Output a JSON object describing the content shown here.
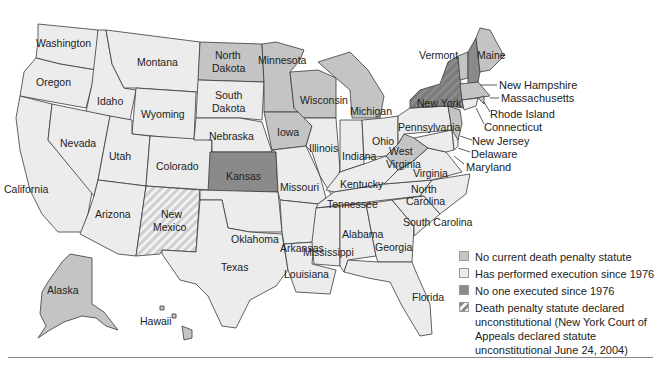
{
  "colors": {
    "no_statute": "#c4c4c4",
    "executed": "#ececec",
    "not_executed": "#8a8a8a",
    "unconstitutional_stripe": "#cfcfcf",
    "background": "#ffffff",
    "border": "#3a3a3a"
  },
  "legend": {
    "items": [
      {
        "key": "no_statute",
        "label": "No current death penalty statute"
      },
      {
        "key": "executed",
        "label": "Has performed execution since 1976"
      },
      {
        "key": "not_executed",
        "label": "No one executed since 1976"
      },
      {
        "key": "unconstitutional",
        "label": "Death penalty statute declared unconstitutional (New York Court of Appeals declared statute unconstitutional June 24, 2004)"
      }
    ]
  },
  "states": {
    "washington": {
      "label": "Washington",
      "category": "executed"
    },
    "oregon": {
      "label": "Oregon",
      "category": "executed"
    },
    "california": {
      "label": "California",
      "category": "executed"
    },
    "idaho": {
      "label": "Idaho",
      "category": "executed"
    },
    "nevada": {
      "label": "Nevada",
      "category": "executed"
    },
    "montana": {
      "label": "Montana",
      "category": "executed"
    },
    "wyoming": {
      "label": "Wyoming",
      "category": "executed"
    },
    "utah": {
      "label": "Utah",
      "category": "executed"
    },
    "arizona": {
      "label": "Arizona",
      "category": "executed"
    },
    "colorado": {
      "label": "Colorado",
      "category": "executed"
    },
    "new_mexico": {
      "label1": "New",
      "label2": "Mexico",
      "category": "unconstitutional"
    },
    "north_dakota": {
      "label1": "North",
      "label2": "Dakota",
      "category": "no_statute"
    },
    "south_dakota": {
      "label1": "South",
      "label2": "Dakota",
      "category": "executed"
    },
    "nebraska": {
      "label": "Nebraska",
      "category": "executed"
    },
    "kansas": {
      "label": "Kansas",
      "category": "not_executed"
    },
    "oklahoma": {
      "label": "Oklahoma",
      "category": "executed"
    },
    "texas": {
      "label": "Texas",
      "category": "executed"
    },
    "minnesota": {
      "label": "Minnesota",
      "category": "no_statute"
    },
    "iowa": {
      "label": "Iowa",
      "category": "no_statute"
    },
    "missouri": {
      "label": "Missouri",
      "category": "executed"
    },
    "arkansas": {
      "label": "Arkansas",
      "category": "executed"
    },
    "louisiana": {
      "label": "Louisiana",
      "category": "executed"
    },
    "wisconsin": {
      "label": "Wisconsin",
      "category": "no_statute"
    },
    "illinois": {
      "label": "Illinois",
      "category": "executed"
    },
    "michigan": {
      "label": "Michigan",
      "category": "no_statute"
    },
    "indiana": {
      "label": "Indiana",
      "category": "executed"
    },
    "ohio": {
      "label": "Ohio",
      "category": "executed"
    },
    "kentucky": {
      "label": "Kentucky",
      "category": "executed"
    },
    "tennessee": {
      "label": "Tennessee",
      "category": "executed"
    },
    "mississippi": {
      "label": "Mississippi",
      "category": "executed"
    },
    "alabama": {
      "label": "Alabama",
      "category": "executed"
    },
    "georgia": {
      "label": "Georgia",
      "category": "executed"
    },
    "florida": {
      "label": "Florida",
      "category": "executed"
    },
    "south_carolina": {
      "label": "South Carolina",
      "category": "executed"
    },
    "north_carolina": {
      "label1": "North",
      "label2": "Carolina",
      "category": "executed"
    },
    "virginia": {
      "label": "Virginia",
      "category": "executed"
    },
    "west_virginia": {
      "label1": "West",
      "label2": "Virginia",
      "category": "no_statute"
    },
    "pennsylvania": {
      "label": "Pennsylvania",
      "category": "executed"
    },
    "new_york": {
      "label": "New York",
      "category": "unconstitutional"
    },
    "vermont": {
      "label": "Vermont",
      "category": "no_statute"
    },
    "new_hampshire": {
      "label": "New Hampshire",
      "category": "not_executed"
    },
    "maine": {
      "label": "Maine",
      "category": "no_statute"
    },
    "massachusetts": {
      "label": "Massachusetts",
      "category": "no_statute"
    },
    "rhode_island": {
      "label": "Rhode Island",
      "category": "no_statute"
    },
    "connecticut": {
      "label": "Connecticut",
      "category": "executed"
    },
    "new_jersey": {
      "label": "New Jersey",
      "category": "no_statute"
    },
    "delaware": {
      "label": "Delaware",
      "category": "executed"
    },
    "maryland": {
      "label": "Maryland",
      "category": "executed"
    },
    "alaska": {
      "label": "Alaska",
      "category": "no_statute"
    },
    "hawaii": {
      "label": "Hawaii",
      "category": "no_statute"
    }
  }
}
